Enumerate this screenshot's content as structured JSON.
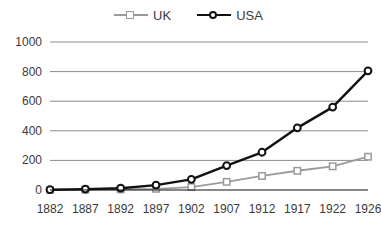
{
  "legend": {
    "position": "top-center",
    "entries": [
      {
        "label": "UK",
        "color": "#9a9a9a",
        "marker": "square-marker"
      },
      {
        "label": "USA",
        "color": "#111111",
        "marker": "circle-marker"
      }
    ]
  },
  "axes": {
    "y_ticks": [
      "0",
      "200",
      "400",
      "600",
      "800",
      "1000"
    ],
    "x_ticks": [
      "1882",
      "1887",
      "1892",
      "1897",
      "1902",
      "1907",
      "1912",
      "1917",
      "1922",
      "1926"
    ]
  },
  "chart_data": {
    "type": "line",
    "title": "",
    "subtitle": "",
    "xlabel": "",
    "ylabel": "",
    "categories": [
      "1882",
      "1887",
      "1892",
      "1897",
      "1902",
      "1907",
      "1912",
      "1917",
      "1922",
      "1926"
    ],
    "x": [
      1882,
      1887,
      1892,
      1897,
      1902,
      1907,
      1912,
      1917,
      1922,
      1926
    ],
    "series": [
      {
        "name": "UK",
        "color": "#9a9a9a",
        "marker": "square-marker",
        "values": [
          0,
          2,
          4,
          8,
          20,
          55,
          95,
          130,
          160,
          225
        ]
      },
      {
        "name": "USA",
        "color": "#111111",
        "marker": "circle-marker",
        "values": [
          2,
          6,
          12,
          33,
          72,
          165,
          255,
          420,
          560,
          805
        ]
      }
    ],
    "xlim": [
      1882,
      1926
    ],
    "ylim": [
      0,
      1000
    ],
    "ytick_step": 200,
    "grid": "horizontal",
    "legend_position": "top-center"
  },
  "colors": {
    "gridline": "#8c8c8c",
    "axis": "#111111",
    "text": "#3a3a3a",
    "background": "#ffffff"
  }
}
